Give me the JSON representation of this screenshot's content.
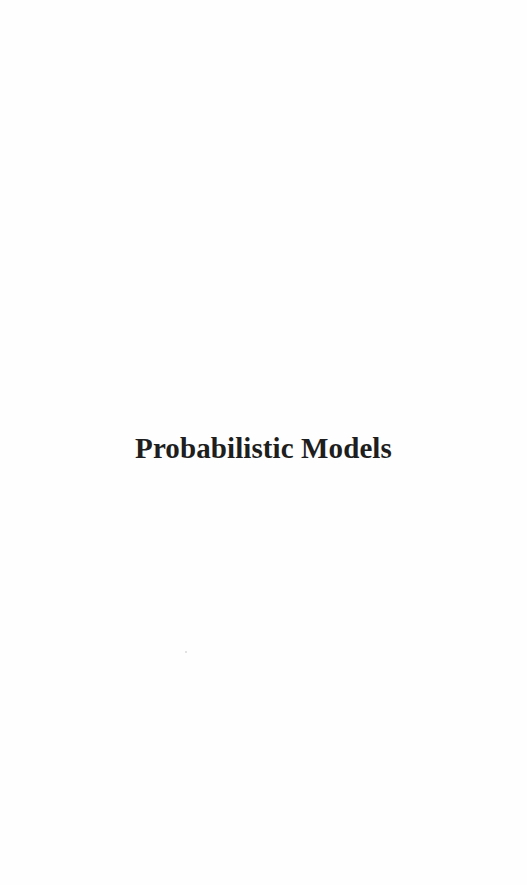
{
  "page": {
    "type": "part-title-page",
    "title": "Probabilistic Models",
    "colors": {
      "background": "#fefefe",
      "text": "#1e1e1e"
    }
  }
}
